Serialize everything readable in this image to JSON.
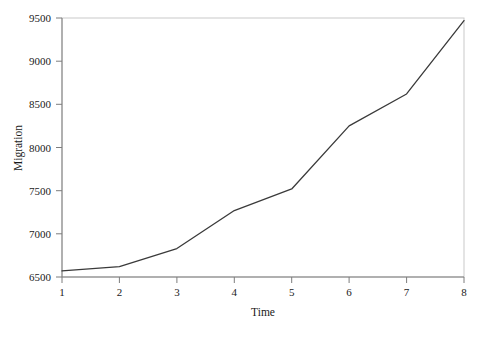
{
  "chart_data": {
    "type": "line",
    "title": "",
    "subtitle": "",
    "xlabel": "Time",
    "ylabel": "Migration",
    "x": [
      1,
      2,
      3,
      4,
      5,
      6,
      7,
      8
    ],
    "values": [
      6570,
      6620,
      6830,
      7270,
      7520,
      8250,
      8620,
      9470
    ],
    "series": [
      {
        "name": "Migration",
        "values": [
          6570,
          6620,
          6830,
          7270,
          7520,
          8250,
          8620,
          9470
        ]
      }
    ],
    "xticks": [
      "1",
      "2",
      "3",
      "4",
      "5",
      "6",
      "7",
      "8"
    ],
    "yticks": [
      "6500",
      "7000",
      "7500",
      "8000",
      "8500",
      "9000",
      "9500"
    ],
    "ytick_values": [
      6500,
      7000,
      7500,
      8000,
      8500,
      9000,
      9500
    ],
    "xlim": [
      1,
      8
    ],
    "ylim": [
      6500,
      9500
    ],
    "grid": false,
    "legend": false,
    "legend_position": "none",
    "line_color": "#3a3a3a",
    "axis_color": "#888888",
    "background_color": "#ffffff",
    "annotations": []
  },
  "axes": {
    "y_title": "Migration",
    "x_title": "Time"
  }
}
